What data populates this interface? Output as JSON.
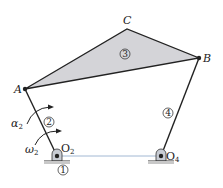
{
  "diagram": {
    "points": {
      "A": {
        "label": "A",
        "x": 25,
        "y": 89
      },
      "B": {
        "label": "B",
        "x": 199,
        "y": 58
      },
      "C": {
        "label": "C",
        "x": 127,
        "y": 29
      },
      "O2": {
        "label": "O",
        "sub": "2",
        "x": 57,
        "y": 156
      },
      "O4": {
        "label": "O",
        "sub": "4",
        "x": 161,
        "y": 156
      }
    },
    "links": [
      {
        "id": "1",
        "label": "1",
        "name": "ground"
      },
      {
        "id": "2",
        "label": "2",
        "name": "crank"
      },
      {
        "id": "3",
        "label": "3",
        "name": "coupler"
      },
      {
        "id": "4",
        "label": "4",
        "name": "rocker"
      }
    ],
    "annotations": {
      "alpha": {
        "symbol": "α",
        "sub": "2"
      },
      "omega": {
        "symbol": "ω",
        "sub": "2"
      }
    },
    "colors": {
      "coupler_fill": "#d4d4d8",
      "line": "#222222",
      "ground_line": "#8aa6c8"
    }
  }
}
